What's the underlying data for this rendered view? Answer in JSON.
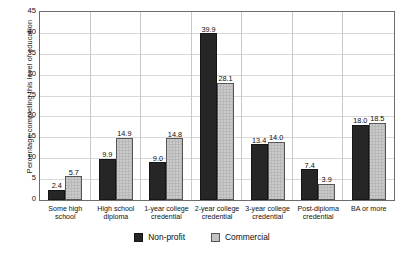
{
  "chart_data": {
    "type": "bar",
    "title": "",
    "subtitle": "",
    "xlabel": "",
    "ylabel": "Percentage completing this level of education",
    "ylim": [
      0,
      45
    ],
    "yticks": [
      0,
      5,
      10,
      15,
      20,
      25,
      30,
      35,
      40,
      45
    ],
    "ytick_labels": [
      "0",
      "5",
      "10",
      "15",
      "20",
      "25",
      "30",
      "35",
      "40",
      "45"
    ],
    "grid": true,
    "legend_position": "bottom",
    "categories": [
      "Some high school",
      "High school diploma",
      "1-year college credential",
      "2-year college credential",
      "3-year college credential",
      "Post-diploma credential",
      "BA or more"
    ],
    "category_lines": [
      [
        "Some high",
        "school"
      ],
      [
        "High school",
        "diploma"
      ],
      [
        "1-year college",
        "credential"
      ],
      [
        "2-year college",
        "credential"
      ],
      [
        "3-year college",
        "credential"
      ],
      [
        "Post-diploma",
        "credential"
      ],
      [
        "BA or more",
        ""
      ]
    ],
    "series": [
      {
        "name": "Non-profit",
        "color": "#262626",
        "values": [
          2.4,
          9.9,
          9.0,
          39.9,
          13.4,
          7.4,
          18.0
        ],
        "labels": [
          "2.4",
          "9.9",
          "9.0",
          "39.9",
          "13.4",
          "7.4",
          "18.0"
        ]
      },
      {
        "name": "Commercial",
        "color": "#b8b8b8",
        "values": [
          5.7,
          14.9,
          14.8,
          28.1,
          14.0,
          3.9,
          18.5
        ],
        "labels": [
          "5.7",
          "14.9",
          "14.8",
          "28.1",
          "14.0",
          "3.9",
          "18.5"
        ]
      }
    ]
  },
  "legend": {
    "items": [
      {
        "label": "Non-profit",
        "swatch": "nonprofit"
      },
      {
        "label": "Commercial",
        "swatch": "commercial"
      }
    ]
  }
}
